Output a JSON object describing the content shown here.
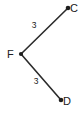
{
  "figure": {
    "background_color": "#ffffff",
    "stroke_color": "#2b2b2b",
    "label_color": "#202020",
    "width": 83,
    "height": 114,
    "vertices": [
      {
        "name": "F",
        "label": "F",
        "x": 21,
        "y": 54,
        "label_x": 11,
        "label_y": 54
      },
      {
        "name": "C",
        "label": "C",
        "x": 68,
        "y": 8,
        "label_x": 74,
        "label_y": 8
      },
      {
        "name": "D",
        "label": "D",
        "x": 61,
        "y": 100,
        "label_x": 67,
        "label_y": 101
      }
    ],
    "segments": [
      {
        "name": "segment-FC",
        "from": "F",
        "to": "C",
        "length_label": "3",
        "label_x": 34,
        "label_y": 26,
        "x1": 21,
        "y1": 54,
        "x2": 68,
        "y2": 8
      },
      {
        "name": "segment-FD",
        "from": "F",
        "to": "D",
        "length_label": "3",
        "label_x": 36,
        "label_y": 82,
        "x1": 21,
        "y1": 54,
        "x2": 61,
        "y2": 100
      }
    ]
  }
}
